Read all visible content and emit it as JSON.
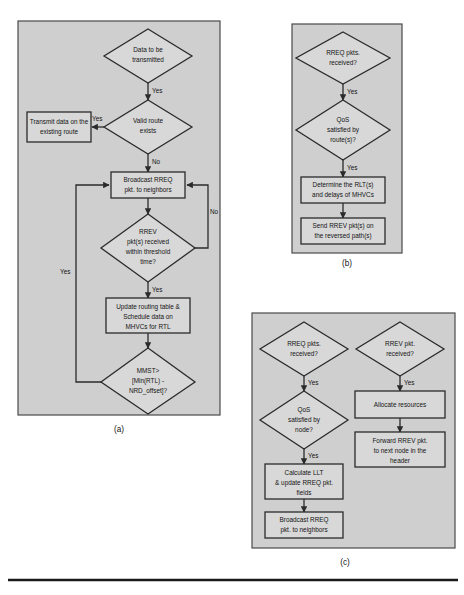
{
  "figure": {
    "type": "flowchart",
    "background_color": "#ffffff",
    "panel_fill": "#cfcfcf",
    "node_fill": "#d8d8d8",
    "stroke_color": "#2b2b2b",
    "panels": [
      {
        "id": "a",
        "caption": "(a)",
        "nodes": [
          {
            "id": "a1",
            "shape": "diamond",
            "lines": [
              "Data to be",
              "transmitted"
            ]
          },
          {
            "id": "a2",
            "shape": "diamond",
            "lines": [
              "Valid route",
              "exists"
            ]
          },
          {
            "id": "a3",
            "shape": "box",
            "lines": [
              "Transmit data on the",
              "existing route"
            ]
          },
          {
            "id": "a4",
            "shape": "box",
            "lines": [
              "Broadcast RREQ",
              "pkt. to neighbors"
            ]
          },
          {
            "id": "a5",
            "shape": "diamond",
            "lines": [
              "RREV",
              "pkt(s) received",
              "within threshold",
              "time?"
            ]
          },
          {
            "id": "a6",
            "shape": "box",
            "lines": [
              "Update routing table &",
              "Schedule data on",
              "MHVCs for RTL"
            ]
          },
          {
            "id": "a7",
            "shape": "diamond",
            "lines": [
              "MMST>",
              "[Min(RTL) -",
              "NRD_offset]?"
            ]
          }
        ],
        "edge_labels": [
          {
            "id": "a-e1",
            "text": "Yes"
          },
          {
            "id": "a-e2",
            "text": "Yes"
          },
          {
            "id": "a-e3",
            "text": "No"
          },
          {
            "id": "a-e4",
            "text": "No"
          },
          {
            "id": "a-e5",
            "text": "Yes"
          },
          {
            "id": "a-e6",
            "text": "Yes"
          }
        ]
      },
      {
        "id": "b",
        "caption": "(b)",
        "nodes": [
          {
            "id": "b1",
            "shape": "diamond",
            "lines": [
              "RREQ pkts.",
              "received?"
            ]
          },
          {
            "id": "b2",
            "shape": "diamond",
            "lines": [
              "QoS",
              "satisfied by",
              "route(s)?"
            ]
          },
          {
            "id": "b3",
            "shape": "box",
            "lines": [
              "Determine the RLT(s)",
              "and delays of MHVCs"
            ]
          },
          {
            "id": "b4",
            "shape": "box",
            "lines": [
              "Send RREV pkt(s) on",
              "the reversed path(s)"
            ]
          }
        ],
        "edge_labels": [
          {
            "id": "b-e1",
            "text": "Yes"
          },
          {
            "id": "b-e2",
            "text": "Yes"
          }
        ]
      },
      {
        "id": "c",
        "caption": "(c)",
        "nodes": [
          {
            "id": "c1",
            "shape": "diamond",
            "lines": [
              "RREQ pkts.",
              "received?"
            ]
          },
          {
            "id": "c2",
            "shape": "diamond",
            "lines": [
              "QoS",
              "satisfied by",
              "node?"
            ]
          },
          {
            "id": "c3",
            "shape": "box",
            "lines": [
              "Calculate LLT",
              "& update RREQ pkt.",
              "fields"
            ]
          },
          {
            "id": "c4",
            "shape": "box",
            "lines": [
              "Broadcast RREQ",
              "pkt. to neighbors"
            ]
          },
          {
            "id": "c5",
            "shape": "diamond",
            "lines": [
              "RREV pkt.",
              "received?"
            ]
          },
          {
            "id": "c6",
            "shape": "box",
            "lines": [
              "Allocate resources"
            ]
          },
          {
            "id": "c7",
            "shape": "box",
            "lines": [
              "Forward RREV pkt.",
              "to next node in the",
              "header"
            ]
          }
        ],
        "edge_labels": [
          {
            "id": "c-e1",
            "text": "Yes"
          },
          {
            "id": "c-e2",
            "text": "Yes"
          },
          {
            "id": "c-e3",
            "text": "Yes"
          }
        ]
      }
    ]
  }
}
